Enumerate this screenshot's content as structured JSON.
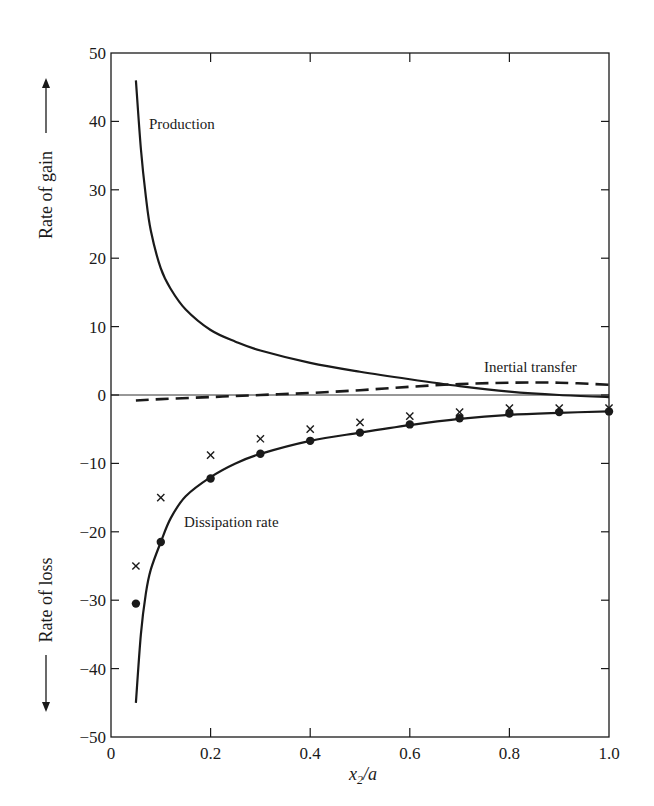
{
  "chart_data": {
    "type": "line",
    "title": "",
    "xlabel": "x2/a",
    "xlabel_main": "x",
    "xlabel_sub": "2",
    "xlabel_tail": "/a",
    "ylabel_top": "Rate of gain",
    "ylabel_bottom": "Rate of loss",
    "xlim": [
      0,
      1.0
    ],
    "ylim": [
      -50,
      50
    ],
    "x_ticks": [
      0,
      0.2,
      0.4,
      0.6,
      0.8,
      1.0
    ],
    "x_tick_labels": [
      "0",
      "0.2",
      "0.4",
      "0.6",
      "0.8",
      "1.0"
    ],
    "y_ticks": [
      50,
      40,
      30,
      20,
      10,
      0,
      -10,
      -20,
      -30,
      -40,
      -50
    ],
    "y_tick_labels": [
      "50",
      "40",
      "30",
      "20",
      "10",
      "0",
      "−10",
      "−20",
      "−30",
      "−40",
      "−50"
    ],
    "grid": false,
    "legend": "none (curves annotated inline)",
    "annotations": [
      "Production",
      "Inertial transfer",
      "Dissipation rate"
    ],
    "series": [
      {
        "name": "Production",
        "style": "solid",
        "x": [
          0.05,
          0.06,
          0.07,
          0.08,
          0.1,
          0.12,
          0.15,
          0.2,
          0.25,
          0.3,
          0.4,
          0.5,
          0.6,
          0.7,
          0.8,
          0.9,
          1.0
        ],
        "y": [
          46,
          36,
          29,
          24,
          18.5,
          15.5,
          12.5,
          9.5,
          7.8,
          6.5,
          4.7,
          3.4,
          2.3,
          1.3,
          0.5,
          0.0,
          -0.3
        ]
      },
      {
        "name": "Inertial transfer",
        "style": "dashed",
        "x": [
          0.05,
          0.1,
          0.2,
          0.3,
          0.4,
          0.5,
          0.6,
          0.7,
          0.8,
          0.9,
          1.0
        ],
        "y": [
          -0.8,
          -0.6,
          -0.3,
          0.0,
          0.3,
          0.7,
          1.2,
          1.6,
          1.8,
          1.8,
          1.5
        ]
      },
      {
        "name": "Dissipation rate",
        "style": "solid",
        "x": [
          0.05,
          0.06,
          0.07,
          0.08,
          0.1,
          0.12,
          0.15,
          0.2,
          0.25,
          0.3,
          0.4,
          0.5,
          0.6,
          0.7,
          0.8,
          0.9,
          1.0
        ],
        "y": [
          -45,
          -35,
          -29,
          -25.5,
          -21.5,
          -18,
          -14.8,
          -12,
          -10,
          -8.6,
          -6.7,
          -5.5,
          -4.4,
          -3.5,
          -2.9,
          -2.6,
          -2.4
        ]
      },
      {
        "name": "Dissipation measured (dots)",
        "style": "marker-circle",
        "x": [
          0.05,
          0.1,
          0.2,
          0.3,
          0.4,
          0.5,
          0.6,
          0.7,
          0.8,
          0.9,
          1.0
        ],
        "y": [
          -30.5,
          -21.5,
          -12.2,
          -8.6,
          -6.7,
          -5.5,
          -4.3,
          -3.4,
          -2.7,
          -2.5,
          -2.4
        ]
      },
      {
        "name": "Dissipation measured (crosses)",
        "style": "marker-x",
        "x": [
          0.05,
          0.1,
          0.2,
          0.3,
          0.4,
          0.5,
          0.6,
          0.7,
          0.8,
          0.9,
          1.0
        ],
        "y": [
          -25,
          -15,
          -8.8,
          -6.4,
          -5.0,
          -4.0,
          -3.1,
          -2.5,
          -1.9,
          -1.9,
          -1.9
        ]
      }
    ]
  },
  "colors": {
    "ink": "#1a1a1a",
    "background": "#ffffff"
  }
}
